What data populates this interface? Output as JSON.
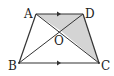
{
  "diagram": {
    "points": {
      "A": {
        "label": "A",
        "x": 36,
        "y": 14
      },
      "D": {
        "label": "D",
        "x": 83,
        "y": 14
      },
      "B": {
        "label": "B",
        "x": 19,
        "y": 63
      },
      "C": {
        "label": "C",
        "x": 99,
        "y": 63
      },
      "O": {
        "label": "O",
        "x": 61,
        "y": 31
      }
    },
    "segments": [
      "AD",
      "BC",
      "AB",
      "DC",
      "AC",
      "BD"
    ],
    "parallel_marks": [
      "AD",
      "BC"
    ],
    "shaded_regions": [
      "triangle AOD",
      "triangle DOC"
    ],
    "colors": {
      "stroke": "#333333",
      "shade": "#d4d4d4",
      "background": "#ffffff"
    }
  }
}
